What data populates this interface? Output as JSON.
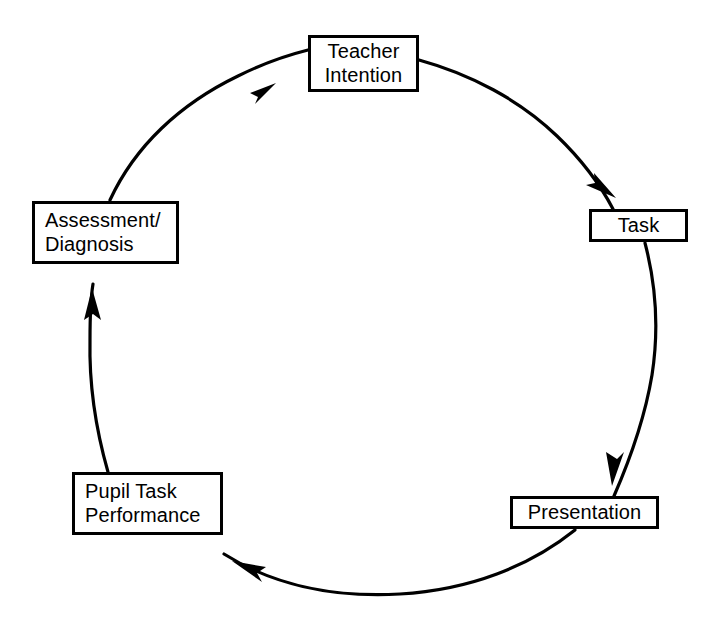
{
  "diagram": {
    "type": "cycle-diagram",
    "direction": "clockwise",
    "colors": {
      "stroke": "#000000",
      "background": "#ffffff",
      "text": "#000000"
    },
    "nodes": [
      {
        "id": "teacher-intention",
        "label": "Teacher\nIntention"
      },
      {
        "id": "task",
        "label": "Task"
      },
      {
        "id": "presentation",
        "label": "Presentation"
      },
      {
        "id": "pupil-task-performance",
        "label": "Pupil Task\nPerformance"
      },
      {
        "id": "assessment-diagnosis",
        "label": "Assessment/\nDiagnosis"
      }
    ],
    "edges": [
      {
        "from": "teacher-intention",
        "to": "task",
        "arrow": true
      },
      {
        "from": "task",
        "to": "presentation",
        "arrow": true
      },
      {
        "from": "presentation",
        "to": "pupil-task-performance",
        "arrow": true
      },
      {
        "from": "pupil-task-performance",
        "to": "assessment-diagnosis",
        "arrow": true
      },
      {
        "from": "assessment-diagnosis",
        "to": "teacher-intention",
        "arrow": true
      }
    ]
  }
}
